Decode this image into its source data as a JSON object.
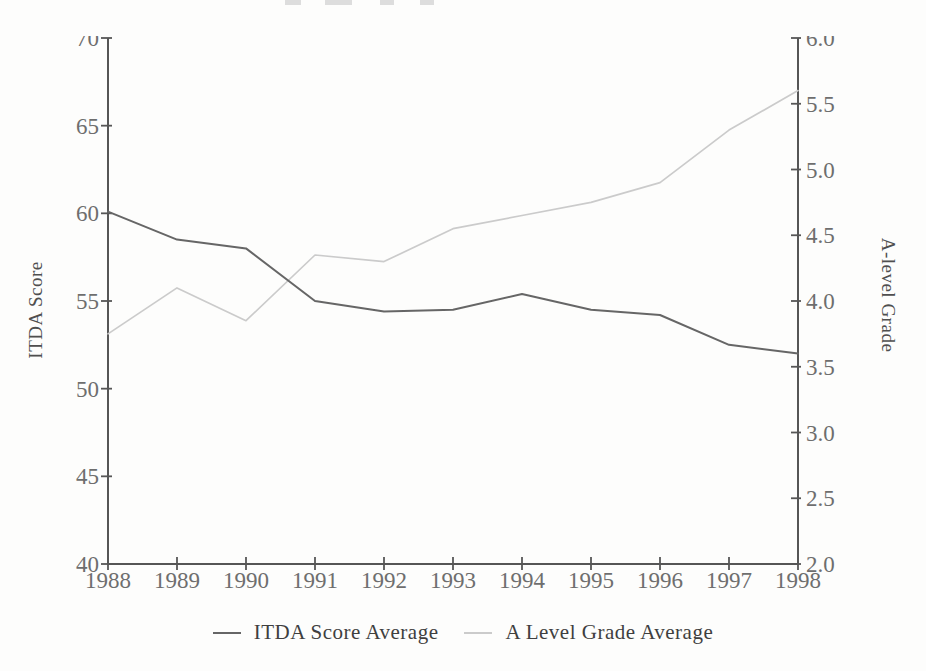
{
  "chart_data": {
    "type": "line",
    "title": "",
    "x": [
      1988,
      1989,
      1990,
      1991,
      1992,
      1993,
      1994,
      1995,
      1996,
      1997,
      1998
    ],
    "x_axis": {
      "min": 1988,
      "max": 1998,
      "tick_values": [
        1988,
        1989,
        1990,
        1991,
        1992,
        1993,
        1994,
        1995,
        1996,
        1997,
        1998
      ],
      "tick_labels": [
        "1988",
        "1989",
        "1990",
        "1991",
        "1992",
        "1993",
        "1994",
        "1995",
        "1996",
        "1997",
        "1998"
      ]
    },
    "left_axis": {
      "label": "ITDA Score",
      "min": 40,
      "max": 70,
      "tick_values": [
        70,
        65,
        60,
        55,
        50,
        45,
        40
      ],
      "tick_labels": [
        "70",
        "65",
        "60",
        "55",
        "50",
        "45",
        "40"
      ]
    },
    "right_axis": {
      "label": "A-level Grade",
      "min": 2.0,
      "max": 6.0,
      "tick_values": [
        6.0,
        5.5,
        5.0,
        4.5,
        4.0,
        3.5,
        3.0,
        2.5,
        2.0
      ],
      "tick_labels": [
        "6.0",
        "5.5",
        "5.0",
        "4.5",
        "4.0",
        "3.5",
        "3.0",
        "2.5",
        "2.0"
      ]
    },
    "series": [
      {
        "name": "ITDA Score Average",
        "axis": "left",
        "color": "#666666",
        "values": [
          60.1,
          58.5,
          58.0,
          55.0,
          54.4,
          54.5,
          55.4,
          54.5,
          54.2,
          52.5,
          52.0
        ]
      },
      {
        "name": "A Level Grade Average",
        "axis": "right",
        "color": "#cbcbcb",
        "values": [
          3.75,
          4.1,
          3.85,
          4.35,
          4.3,
          4.55,
          4.65,
          4.75,
          4.9,
          5.3,
          5.6
        ]
      }
    ],
    "legend_position": "bottom",
    "grid": false
  },
  "colors": {
    "axis_line": "#565656",
    "tick_label": "#6e6e6e",
    "legend_text": "#3f3f3f"
  }
}
